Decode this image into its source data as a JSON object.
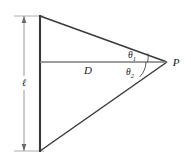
{
  "figure": {
    "kind": "geometry-diagram",
    "background_color": "#ffffff",
    "line_color": "#3a3a3a",
    "dimension_color": "#8a8a8a",
    "text_color": "#1a1a1a",
    "labels": {
      "length": "ℓ",
      "distance": "D",
      "point": "P",
      "angle1_base": "θ",
      "angle1_sub": "1",
      "angle2_base": "θ",
      "angle2_sub": "2"
    },
    "geometry": {
      "vertical_line_x": 40,
      "vertical_top_y": 16,
      "vertical_bottom_y": 151,
      "apex_x": 167,
      "apex_y": 62,
      "horizontal_y": 62,
      "dimension_line_x": 24,
      "dimension_top_y": 16,
      "dimension_bottom_y": 151
    }
  }
}
